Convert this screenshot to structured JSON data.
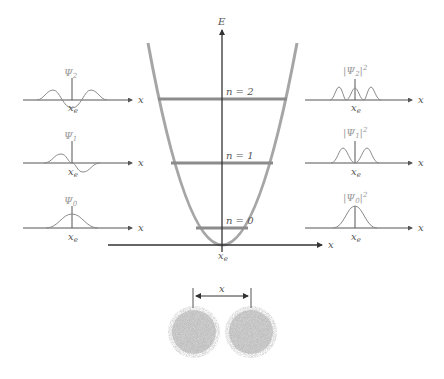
{
  "diagram": {
    "main_plot": {
      "y_axis_label": "E",
      "x_axis_label": "x",
      "origin_label": "x",
      "origin_subscript": "e",
      "levels": [
        {
          "label": "n = 2",
          "y": 99
        },
        {
          "label": "n = 1",
          "y": 163
        },
        {
          "label": "n = 0",
          "y": 228
        }
      ]
    },
    "wavefunctions": [
      {
        "symbol": "Ψ",
        "subscript": "2",
        "axis_label": "x",
        "center_label": "x",
        "center_sub": "e"
      },
      {
        "symbol": "Ψ",
        "subscript": "1",
        "axis_label": "x",
        "center_label": "x",
        "center_sub": "e"
      },
      {
        "symbol": "Ψ",
        "subscript": "0",
        "axis_label": "x",
        "center_label": "x",
        "center_sub": "e"
      }
    ],
    "densities": [
      {
        "prefix": "|Ψ",
        "subscript": "2",
        "suffix": "|",
        "power": "2",
        "axis_label": "x",
        "center_label": "x",
        "center_sub": "e"
      },
      {
        "prefix": "|Ψ",
        "subscript": "1",
        "suffix": "|",
        "power": "2",
        "axis_label": "x",
        "center_label": "x",
        "center_sub": "e"
      },
      {
        "prefix": "|Ψ",
        "subscript": "0",
        "suffix": "|",
        "power": "2",
        "axis_label": "x",
        "center_label": "x",
        "center_sub": "e"
      }
    ],
    "atoms": {
      "separation_label": "x",
      "count": 2
    },
    "colors": {
      "axis": "#555555",
      "main_axis": "#333333",
      "curve": "#8a8a8a",
      "well": "#a6a6a6",
      "level": "#8c8c8c",
      "atom": "#a0a0a0"
    }
  }
}
